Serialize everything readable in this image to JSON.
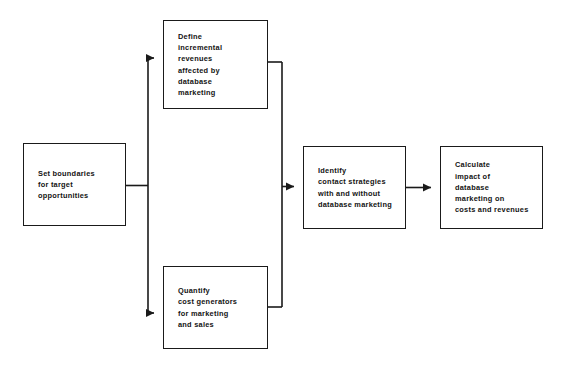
{
  "diagram": {
    "orientation": "left-to-right",
    "line_color": "#1a1a1a",
    "box_fill": "#ffffff",
    "text_color": "#131313",
    "nodes": [
      {
        "id": "set-boundaries",
        "label": "Set boundaries\nfor target\nopportunities",
        "column": 1
      },
      {
        "id": "define-revenues",
        "label": "Define\nincremental\nrevenues\naffected by\ndatabase\nmarketing",
        "column": 2
      },
      {
        "id": "quantify-costs",
        "label": "Quantify\ncost generators\nfor marketing\nand sales",
        "column": 2
      },
      {
        "id": "identify-contact",
        "label": "Identify\ncontact strategies\nwith and without\ndatabase marketing",
        "column": 3
      },
      {
        "id": "calculate-impact",
        "label": "Calculate\nimpact of\ndatabase\nmarketing on\ncosts and revenues",
        "column": 4
      }
    ],
    "connectors": [
      {
        "id": "split-to-define",
        "from": "set-boundaries",
        "to": "define-revenues",
        "style": "branch-up",
        "arrow": true
      },
      {
        "id": "split-to-quantify",
        "from": "set-boundaries",
        "to": "quantify-costs",
        "style": "branch-down",
        "arrow": true
      },
      {
        "id": "merge-from-define",
        "from": "define-revenues",
        "to": "identify-contact",
        "style": "merge-down",
        "arrow": false
      },
      {
        "id": "merge-from-quantify",
        "from": "quantify-costs",
        "to": "identify-contact",
        "style": "merge-up",
        "arrow": false
      },
      {
        "id": "merge-to-identify",
        "from": "merge-trunk",
        "to": "identify-contact",
        "style": "straight",
        "arrow": true
      },
      {
        "id": "identify-to-calculate",
        "from": "identify-contact",
        "to": "calculate-impact",
        "style": "straight",
        "arrow": true
      }
    ]
  }
}
